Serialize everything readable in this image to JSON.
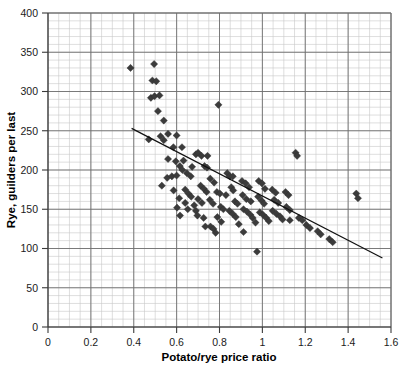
{
  "chart_data": {
    "type": "scatter",
    "title": "",
    "xlabel": "Potato/rye price ratio",
    "ylabel": "Rye, guilders per last",
    "xlim": [
      0,
      1.6
    ],
    "ylim": [
      0,
      400
    ],
    "x_ticks": [
      "0",
      "0.2",
      "0.4",
      "0.6",
      "0.8",
      "1",
      "1.2",
      "1.4",
      "1.6"
    ],
    "x_tick_values": [
      0,
      0.2,
      0.4,
      0.6,
      0.8,
      1.0,
      1.2,
      1.4,
      1.6
    ],
    "y_ticks": [
      "0",
      "50",
      "100",
      "150",
      "200",
      "250",
      "300",
      "350",
      "400"
    ],
    "y_tick_values": [
      0,
      50,
      100,
      150,
      200,
      250,
      300,
      350,
      400
    ],
    "grid": true,
    "grid_minor_x_step": 0.05,
    "grid_minor_y_step": 10,
    "grid_major_x_step": 0.2,
    "grid_major_y_step": 50,
    "legend": null,
    "marker": "diamond",
    "marker_color": "#3b3b3b",
    "marker_size": 6,
    "trend_line": {
      "type": "linear",
      "x_start": 0.39,
      "y_start": 253,
      "x_end": 1.56,
      "y_end": 88,
      "color": "#111111"
    },
    "points": [
      [
        0.385,
        330
      ],
      [
        0.495,
        335
      ],
      [
        0.487,
        314
      ],
      [
        0.505,
        313
      ],
      [
        0.48,
        292
      ],
      [
        0.497,
        294
      ],
      [
        0.52,
        295
      ],
      [
        0.513,
        275
      ],
      [
        0.54,
        263
      ],
      [
        0.47,
        239
      ],
      [
        0.525,
        243
      ],
      [
        0.54,
        238
      ],
      [
        0.795,
        283
      ],
      [
        0.585,
        229
      ],
      [
        0.625,
        229
      ],
      [
        0.56,
        214
      ],
      [
        0.596,
        211
      ],
      [
        0.615,
        205
      ],
      [
        0.627,
        200
      ],
      [
        0.648,
        196
      ],
      [
        0.666,
        192
      ],
      [
        0.69,
        220
      ],
      [
        0.7,
        222
      ],
      [
        0.716,
        218
      ],
      [
        0.556,
        190
      ],
      [
        0.578,
        192
      ],
      [
        0.6,
        193
      ],
      [
        0.531,
        180
      ],
      [
        0.64,
        175
      ],
      [
        0.655,
        170
      ],
      [
        0.668,
        166
      ],
      [
        0.652,
        150
      ],
      [
        0.69,
        148
      ],
      [
        0.73,
        205
      ],
      [
        0.742,
        203
      ],
      [
        0.757,
        189
      ],
      [
        0.775,
        184
      ],
      [
        0.712,
        180
      ],
      [
        0.727,
        176
      ],
      [
        0.74,
        172
      ],
      [
        0.7,
        163
      ],
      [
        0.718,
        158
      ],
      [
        0.682,
        155
      ],
      [
        0.697,
        142
      ],
      [
        0.726,
        139
      ],
      [
        0.755,
        162
      ],
      [
        0.77,
        157
      ],
      [
        0.788,
        172
      ],
      [
        0.802,
        170
      ],
      [
        0.806,
        153
      ],
      [
        0.818,
        150
      ],
      [
        0.79,
        140
      ],
      [
        0.808,
        134
      ],
      [
        0.758,
        128
      ],
      [
        0.772,
        125
      ],
      [
        0.836,
        196
      ],
      [
        0.848,
        192
      ],
      [
        0.855,
        178
      ],
      [
        0.864,
        174
      ],
      [
        0.872,
        160
      ],
      [
        0.884,
        157
      ],
      [
        0.846,
        148
      ],
      [
        0.862,
        144
      ],
      [
        0.876,
        140
      ],
      [
        0.89,
        131
      ],
      [
        0.905,
        186
      ],
      [
        0.922,
        183
      ],
      [
        0.938,
        178
      ],
      [
        0.908,
        168
      ],
      [
        0.925,
        163
      ],
      [
        0.946,
        160
      ],
      [
        0.912,
        150
      ],
      [
        0.928,
        147
      ],
      [
        0.944,
        143
      ],
      [
        0.955,
        139
      ],
      [
        0.968,
        133
      ],
      [
        0.912,
        121
      ],
      [
        0.983,
        186
      ],
      [
        0.998,
        183
      ],
      [
        1.012,
        176
      ],
      [
        0.98,
        166
      ],
      [
        0.996,
        161
      ],
      [
        1.008,
        157
      ],
      [
        0.988,
        146
      ],
      [
        1.003,
        143
      ],
      [
        1.018,
        139
      ],
      [
        1.03,
        135
      ],
      [
        0.975,
        96
      ],
      [
        1.046,
        175
      ],
      [
        1.062,
        171
      ],
      [
        1.055,
        162
      ],
      [
        1.074,
        158
      ],
      [
        1.048,
        148
      ],
      [
        1.066,
        144
      ],
      [
        1.082,
        141
      ],
      [
        1.094,
        137
      ],
      [
        1.108,
        172
      ],
      [
        1.122,
        168
      ],
      [
        1.112,
        153
      ],
      [
        1.128,
        149
      ],
      [
        1.155,
        222
      ],
      [
        1.162,
        218
      ],
      [
        1.17,
        139
      ],
      [
        1.186,
        136
      ],
      [
        1.205,
        130
      ],
      [
        1.222,
        126
      ],
      [
        1.258,
        122
      ],
      [
        1.272,
        118
      ],
      [
        1.312,
        112
      ],
      [
        1.328,
        108
      ],
      [
        1.438,
        170
      ],
      [
        1.446,
        164
      ],
      [
        0.56,
        246
      ],
      [
        0.6,
        244
      ],
      [
        0.632,
        212
      ],
      [
        0.672,
        204
      ],
      [
        0.744,
        218
      ],
      [
        0.612,
        164
      ],
      [
        0.64,
        158
      ],
      [
        0.586,
        174
      ],
      [
        0.602,
        152
      ],
      [
        0.616,
        142
      ],
      [
        0.83,
        168
      ],
      [
        0.862,
        192
      ],
      [
        1.128,
        136
      ],
      [
        0.782,
        120
      ],
      [
        0.734,
        128
      ]
    ]
  }
}
